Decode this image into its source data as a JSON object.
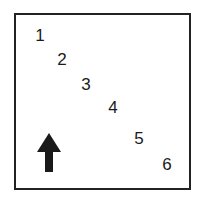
{
  "diagram": {
    "labels": [
      {
        "text": "1",
        "x": 40,
        "y": 35
      },
      {
        "text": "2",
        "x": 62,
        "y": 59
      },
      {
        "text": "3",
        "x": 86,
        "y": 84
      },
      {
        "text": "4",
        "x": 113,
        "y": 107
      },
      {
        "text": "5",
        "x": 139,
        "y": 138
      },
      {
        "text": "6",
        "x": 167,
        "y": 164
      }
    ],
    "arrow": {
      "direction": "up",
      "icon": "arrow-up-icon",
      "color": "#1a1a1a"
    },
    "border_color": "#222222"
  }
}
